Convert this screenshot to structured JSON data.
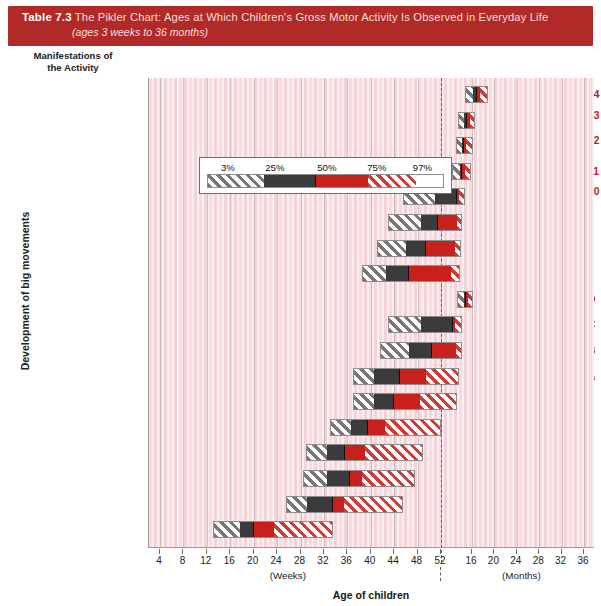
{
  "title": {
    "table_number": "Table 7.3",
    "line1": "The Pikler Chart: Ages at Which Children's Gross Motor Activity Is Observed in Everyday Life",
    "line2": "(ages 3 weeks to 36 months)"
  },
  "headers": {
    "column_header_line1": "Manifestations of",
    "column_header_line2": "the Activity",
    "y_axis_caption": "Development of big movements",
    "x_axis_title": "Age of children",
    "weeks_unit": "(Weeks)",
    "months_unit": "(Months)"
  },
  "legend": {
    "labels": [
      "3%",
      "25%",
      "50%",
      "75%",
      "97%"
    ],
    "band_colors": {
      "p3_p25": "#777777",
      "p25_p50": "#3b3b3b",
      "p50_p75": "#c8201c",
      "p75_p97": "#d23a36"
    }
  },
  "colors": {
    "title_bar": "#b22a28",
    "row_number": "#b5231f",
    "plot_background": "#f3d3d7"
  },
  "chart_data": {
    "type": "bar",
    "title": "The Pikler Chart: Ages at Which Children's Gross Motor Activity Is Observed in Everyday Life",
    "subtitle": "(ages 3 weeks to 36 months)",
    "xlabel": "Age of children",
    "ylabel": "Development of big movements",
    "grid": true,
    "legend_position": "inside-upper-left",
    "x_axis": {
      "weeks_ticks": [
        4,
        8,
        12,
        16,
        20,
        24,
        28,
        32,
        36,
        40,
        44,
        48,
        52
      ],
      "months_ticks": [
        16,
        20,
        24,
        28,
        32,
        36
      ],
      "weeks_unit": "(Weeks)",
      "months_unit": "(Months)",
      "break_at": "52 weeks / 12 months"
    },
    "series_bands": [
      "3%-25%",
      "25%-50%",
      "50%-75%",
      "75%-97%"
    ],
    "rows": [
      {
        "id": "14",
        "label_line1": "Walks on stairs I",
        "label_line2": "",
        "p3": 64.0,
        "p25": 69.5,
        "p50": 73.0,
        "p75": 76.0,
        "p97": 82.0
      },
      {
        "id": "13",
        "label_line1": "Walks from",
        "label_line2": "place to place",
        "p3": 58.5,
        "p25": 63.0,
        "p50": 65.5,
        "p75": 68.0,
        "p97": 72.0
      },
      {
        "id": "12",
        "label_line1": "Takes one or two",
        "label_line2": "steps independently",
        "p3": 57.0,
        "p25": 61.5,
        "p50": 63.0,
        "p75": 65.0,
        "p97": 70.5
      },
      {
        "id": "11",
        "label_line1": "Stands up freely",
        "label_line2": "",
        "p3": 54.0,
        "p25": 60.0,
        "p50": 62.0,
        "p75": 64.0,
        "p97": 68.5
      },
      {
        "id": "10",
        "label_line1": "Takes some steps while",
        "label_line2": "holding onto something",
        "p3": 45.5,
        "p25": 51.0,
        "p50": 58.5,
        "p75": 60.0,
        "p97": 64.0
      },
      {
        "id": "9",
        "label_line1": "Stands up holding",
        "label_line2": "onto something",
        "p3": 43.0,
        "p25": 48.5,
        "p50": 51.5,
        "p75": 58.5,
        "p97": 62.0
      },
      {
        "id": "8",
        "label_line1": "Kneels",
        "label_line2": "",
        "p3": 41.0,
        "p25": 46.0,
        "p50": 49.5,
        "p75": 57.0,
        "p97": 61.0
      },
      {
        "id": "7",
        "label_line1": "Crawls on all fours",
        "label_line2": "",
        "p3": 38.5,
        "p25": 42.5,
        "p50": 46.5,
        "p75": 54.0,
        "p97": 60.0
      },
      {
        "id": "D",
        "label_line1": "Sits on chair",
        "label_line2": "",
        "p3": 57.5,
        "p25": 63.0,
        "p50": 64.5,
        "p75": 66.5,
        "p97": 70.0
      },
      {
        "id": "C",
        "label_line1": "Plays in sitting position",
        "label_line2": "",
        "p3": 43.0,
        "p25": 48.5,
        "p50": 55.0,
        "p75": 57.0,
        "p97": 61.5
      },
      {
        "id": "B",
        "label_line1": "Sits up",
        "label_line2": "",
        "p3": 41.5,
        "p25": 46.5,
        "p50": 50.5,
        "p75": 57.5,
        "p97": 61.5
      },
      {
        "id": "A",
        "label_line1": "Sits up partly",
        "label_line2": "",
        "p3": 37.0,
        "p25": 40.5,
        "p50": 45.0,
        "p75": 49.5,
        "p97": 59.5
      },
      {
        "id": "6",
        "label_line1": "Gets about crawling",
        "label_line2": "",
        "p3": 37.0,
        "p25": 40.5,
        "p50": 44.0,
        "p75": 48.5,
        "p97": 57.5
      },
      {
        "id": "5",
        "label_line1": "Gets about rolling",
        "label_line2": "",
        "p3": 33.0,
        "p25": 36.5,
        "p50": 39.5,
        "p75": 42.5,
        "p97": 52.0
      },
      {
        "id": "4",
        "label_line1": "Plays lying on stomach",
        "label_line2": "",
        "p3": 29.0,
        "p25": 32.5,
        "p50": 35.5,
        "p75": 39.0,
        "p97": 49.0
      },
      {
        "id": "3",
        "label_line1": "Turns to stomach",
        "label_line2": "and back again",
        "p3": 28.5,
        "p25": 32.5,
        "p50": 36.5,
        "p75": 38.5,
        "p97": 47.5
      },
      {
        "id": "2",
        "label_line1": "Turns over on stomach",
        "label_line2": "",
        "p3": 25.5,
        "p25": 29.0,
        "p50": 33.5,
        "p75": 35.5,
        "p97": 45.5
      },
      {
        "id": "1",
        "label_line1": "Turns sideways",
        "label_line2": "",
        "p3": 13.0,
        "p25": 17.5,
        "p50": 20.0,
        "p75": 23.5,
        "p97": 33.5
      }
    ]
  }
}
